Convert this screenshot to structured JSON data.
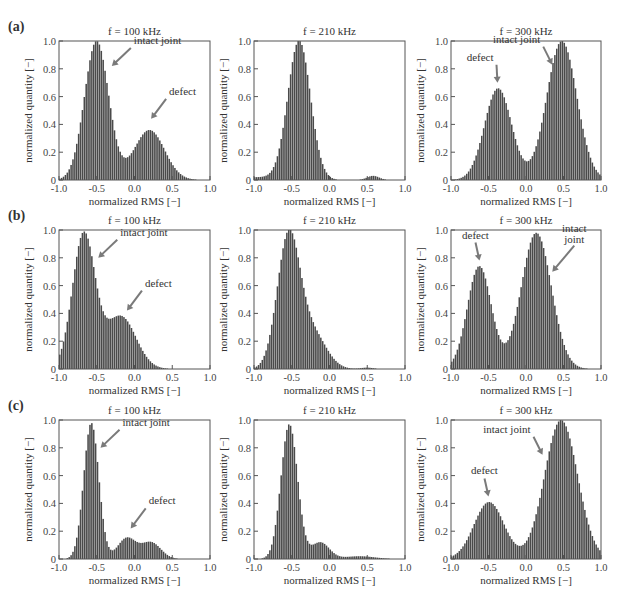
{
  "figure": {
    "xlabel": "normalized RMS [−]",
    "ylabel": "normalized quantity [−]",
    "xticks": [
      "-1.0",
      "-0.5",
      "0.0",
      "0.5",
      "1.0"
    ],
    "yticks": [
      "0",
      "0.2",
      "0.4",
      "0.6",
      "0.8",
      "1.0"
    ],
    "bar_color": "#4a4a4a",
    "arrow_color": "#7a7a7a"
  },
  "rows": [
    {
      "label": "(a)"
    },
    {
      "label": "(b)"
    },
    {
      "label": "(c)"
    }
  ],
  "chart_data": [
    {
      "type": "bar",
      "row": "a",
      "title": "f = 100 kHz",
      "xlabel": "normalized RMS [−]",
      "ylabel": "normalized quantity [−]",
      "xlim": [
        -1,
        1
      ],
      "ylim": [
        0,
        1
      ],
      "peaks": [
        {
          "center": -0.5,
          "height": 1.0,
          "width": 0.16
        },
        {
          "center": 0.2,
          "height": 0.36,
          "width": 0.2
        }
      ],
      "annotations": [
        {
          "text": "intact joint",
          "peak_x": -0.3,
          "peak_y": 0.82
        },
        {
          "text": "defect",
          "peak_x": 0.22,
          "peak_y": 0.44
        }
      ]
    },
    {
      "type": "bar",
      "row": "a",
      "title": "f = 210 kHz",
      "xlabel": "normalized RMS [−]",
      "ylabel": "normalized quantity [−]",
      "xlim": [
        -1,
        1
      ],
      "ylim": [
        0,
        1
      ],
      "peaks": [
        {
          "center": -0.4,
          "height": 1.0,
          "width": 0.15
        },
        {
          "center": 0.58,
          "height": 0.03,
          "width": 0.08
        },
        {
          "center": -1.0,
          "height": 0.02,
          "width": 0.3
        }
      ],
      "annotations": []
    },
    {
      "type": "bar",
      "row": "a",
      "title": "f = 300 kHz",
      "xlabel": "normalized RMS [−]",
      "ylabel": "normalized quantity [−]",
      "xlim": [
        -1,
        1
      ],
      "ylim": [
        0,
        1
      ],
      "peaks": [
        {
          "center": -0.37,
          "height": 0.66,
          "width": 0.18
        },
        {
          "center": 0.48,
          "height": 1.0,
          "width": 0.2
        }
      ],
      "annotations": [
        {
          "text": "defect",
          "peak_x": -0.38,
          "peak_y": 0.7
        },
        {
          "text": "intact joint",
          "peak_x": 0.35,
          "peak_y": 0.83
        }
      ]
    },
    {
      "type": "bar",
      "row": "b",
      "title": "f = 100 kHz",
      "xlabel": "normalized RMS [−]",
      "ylabel": "normalized quantity [−]",
      "xlim": [
        -1,
        1
      ],
      "ylim": [
        0,
        1
      ],
      "peaks": [
        {
          "center": -0.67,
          "height": 0.97,
          "width": 0.15
        },
        {
          "center": -0.18,
          "height": 0.38,
          "width": 0.2
        }
      ],
      "annotations": [
        {
          "text": "intact joint",
          "peak_x": -0.48,
          "peak_y": 0.8
        },
        {
          "text": "defect",
          "peak_x": -0.1,
          "peak_y": 0.42
        }
      ]
    },
    {
      "type": "bar",
      "row": "b",
      "title": "f = 210 kHz",
      "xlabel": "normalized RMS [−]",
      "ylabel": "normalized quantity [−]",
      "xlim": [
        -1,
        1
      ],
      "ylim": [
        0,
        1
      ],
      "peaks": [
        {
          "center": -0.54,
          "height": 0.95,
          "width": 0.15
        },
        {
          "center": -0.22,
          "height": 0.25,
          "width": 0.18
        },
        {
          "center": 0.5,
          "height": 0.01,
          "width": 0.08
        }
      ],
      "annotations": []
    },
    {
      "type": "bar",
      "row": "b",
      "title": "f = 300 kHz",
      "xlabel": "normalized RMS [−]",
      "ylabel": "normalized quantity [−]",
      "xlim": [
        -1,
        1
      ],
      "ylim": [
        0,
        1
      ],
      "peaks": [
        {
          "center": -0.62,
          "height": 0.74,
          "width": 0.16
        },
        {
          "center": 0.14,
          "height": 0.98,
          "width": 0.2
        }
      ],
      "annotations": [
        {
          "text": "defect",
          "peak_x": -0.62,
          "peak_y": 0.78
        },
        {
          "text": "intact joint",
          "peak_x": 0.35,
          "peak_y": 0.7
        }
      ]
    },
    {
      "type": "bar",
      "row": "c",
      "title": "f = 100 kHz",
      "xlabel": "normalized RMS [−]",
      "ylabel": "normalized quantity [−]",
      "xlim": [
        -1,
        1
      ],
      "ylim": [
        0,
        1
      ],
      "peaks": [
        {
          "center": -0.57,
          "height": 0.98,
          "width": 0.1
        },
        {
          "center": -0.1,
          "height": 0.15,
          "width": 0.12
        },
        {
          "center": 0.22,
          "height": 0.12,
          "width": 0.13
        }
      ],
      "annotations": [
        {
          "text": "intact joint",
          "peak_x": -0.45,
          "peak_y": 0.8
        },
        {
          "text": "defect",
          "peak_x": -0.05,
          "peak_y": 0.22
        }
      ]
    },
    {
      "type": "bar",
      "row": "c",
      "title": "f = 210 kHz",
      "xlabel": "normalized RMS [−]",
      "ylabel": "normalized quantity [−]",
      "xlim": [
        -1,
        1
      ],
      "ylim": [
        0,
        1
      ],
      "peaks": [
        {
          "center": -0.53,
          "height": 0.97,
          "width": 0.11
        },
        {
          "center": -0.12,
          "height": 0.12,
          "width": 0.12
        },
        {
          "center": 0.4,
          "height": 0.02,
          "width": 0.2
        }
      ],
      "annotations": []
    },
    {
      "type": "bar",
      "row": "c",
      "title": "f = 300 kHz",
      "xlabel": "normalized RMS [−]",
      "ylabel": "normalized quantity [−]",
      "xlim": [
        -1,
        1
      ],
      "ylim": [
        0,
        1
      ],
      "peaks": [
        {
          "center": -0.49,
          "height": 0.41,
          "width": 0.2
        },
        {
          "center": 0.47,
          "height": 1.0,
          "width": 0.22
        }
      ],
      "annotations": [
        {
          "text": "defect",
          "peak_x": -0.5,
          "peak_y": 0.45
        },
        {
          "text": "intact joint",
          "peak_x": 0.22,
          "peak_y": 0.75
        }
      ]
    }
  ]
}
